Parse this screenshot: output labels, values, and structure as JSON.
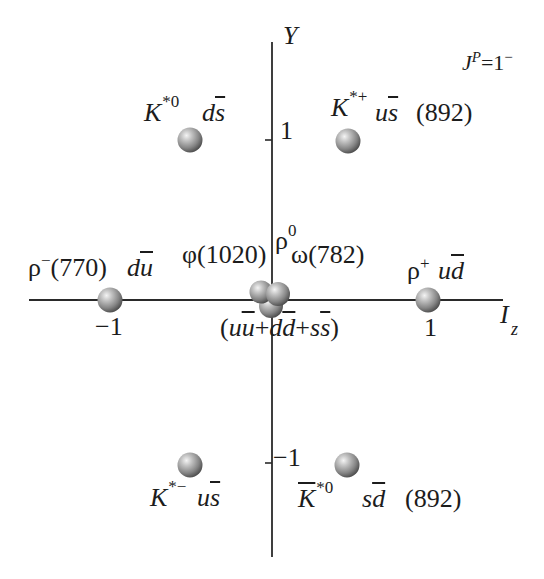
{
  "figure": {
    "jp_label": {
      "j": "J",
      "p": "P",
      "value": "=1",
      "parity": "−"
    },
    "axes": {
      "y": {
        "label": "Y",
        "ticks": {
          "plus_one": "1",
          "minus_one": "−1"
        }
      },
      "x": {
        "label": "I",
        "label_sub": "z",
        "ticks": {
          "minus_one": "−1",
          "plus_one": "1"
        }
      }
    },
    "particles": {
      "k_star_0": {
        "symbol": "K",
        "sup": "*0",
        "quark": "d",
        "antiquark": "s",
        "Iz": -0.5,
        "Y": 1
      },
      "k_star_plus": {
        "symbol": "K",
        "sup": "*+",
        "quark": "u",
        "antiquark": "s",
        "mass": "(892)",
        "Iz": 0.5,
        "Y": 1
      },
      "rho_minus": {
        "symbol": "ρ",
        "sup": "−",
        "mass": "(770)",
        "quark": "d",
        "antiquark": "u",
        "Iz": -1,
        "Y": 0
      },
      "rho_plus": {
        "symbol": "ρ",
        "sup": "+",
        "quark": "u",
        "antiquark": "d",
        "Iz": 1,
        "Y": 0
      },
      "phi": {
        "symbol": "φ",
        "mass": "(1020)",
        "Iz": 0,
        "Y": 0
      },
      "rho_zero": {
        "symbol": "ρ",
        "sup": "0",
        "Iz": 0,
        "Y": 0
      },
      "omega": {
        "symbol": "ω",
        "mass": "(782)",
        "Iz": 0,
        "Y": 0
      },
      "k_star_minus": {
        "symbol": "K",
        "sup": "*−",
        "quark": "u",
        "antiquark": "s",
        "Iz": -0.5,
        "Y": -1
      },
      "k_star_0_bar": {
        "symbol": "K",
        "symbol_bar": true,
        "sup": "*0",
        "quark": "s",
        "antiquark": "d",
        "mass": "(892)",
        "Iz": 0.5,
        "Y": -1
      }
    },
    "neutral_mix": {
      "open": "(",
      "a": "u",
      "a_bar": "u",
      "plus1": "+",
      "b": "d",
      "b_bar": "d",
      "plus2": "+",
      "c": "s",
      "c_bar": "s",
      "close": ")"
    },
    "colors": {
      "axis": "#2a2a2a",
      "ball_light": "#f2f2f2",
      "ball_dark": "#4a4a4a",
      "text": "#1c1c1c"
    }
  }
}
